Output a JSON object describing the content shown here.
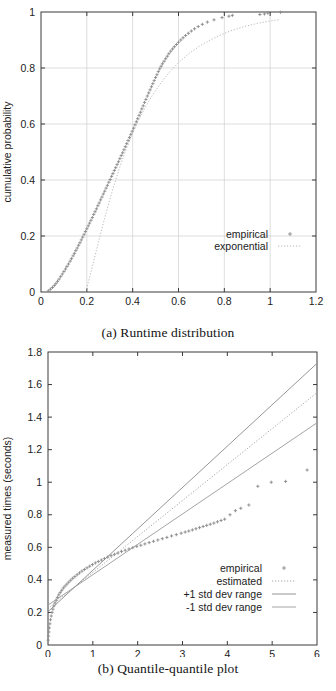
{
  "figure_a": {
    "caption": "(a) Runtime distribution",
    "legend": [
      {
        "label": "empirical",
        "style": "points",
        "color": "#8a8a8a"
      },
      {
        "label": "exponential",
        "style": "dotted",
        "color": "#b0b0b0"
      }
    ],
    "chart_data": {
      "type": "line",
      "title": "",
      "xlabel": "time to target solution value (seconds)",
      "ylabel": "cumulative probability",
      "xlim": [
        0,
        1.2
      ],
      "ylim": [
        0,
        1
      ],
      "xticks": [
        "0",
        "0.2",
        "0.4",
        "0.6",
        "0.8",
        "1",
        "1.2"
      ],
      "xtick_values": [
        0,
        0.2,
        0.4,
        0.6,
        0.8,
        1.0,
        1.2
      ],
      "yticks": [
        "0",
        "0.2",
        "0.4",
        "0.6",
        "0.8",
        "1"
      ],
      "ytick_values": [
        0,
        0.2,
        0.4,
        0.6,
        0.8,
        1.0
      ],
      "grid": true,
      "legend_position": "bottom-right",
      "series": [
        {
          "name": "empirical",
          "x": [
            0.032,
            0.041,
            0.05,
            0.058,
            0.065,
            0.072,
            0.079,
            0.086,
            0.093,
            0.1,
            0.107,
            0.113,
            0.12,
            0.127,
            0.133,
            0.14,
            0.146,
            0.152,
            0.158,
            0.164,
            0.17,
            0.176,
            0.182,
            0.188,
            0.194,
            0.2,
            0.206,
            0.212,
            0.218,
            0.224,
            0.23,
            0.236,
            0.242,
            0.248,
            0.254,
            0.26,
            0.266,
            0.272,
            0.278,
            0.284,
            0.29,
            0.296,
            0.302,
            0.308,
            0.314,
            0.32,
            0.326,
            0.332,
            0.338,
            0.344,
            0.35,
            0.356,
            0.362,
            0.368,
            0.374,
            0.38,
            0.386,
            0.392,
            0.398,
            0.404,
            0.41,
            0.416,
            0.422,
            0.428,
            0.434,
            0.44,
            0.446,
            0.452,
            0.458,
            0.464,
            0.47,
            0.476,
            0.482,
            0.488,
            0.494,
            0.5,
            0.506,
            0.512,
            0.518,
            0.524,
            0.53,
            0.537,
            0.544,
            0.551,
            0.558,
            0.566,
            0.574,
            0.582,
            0.591,
            0.6,
            0.61,
            0.62,
            0.631,
            0.643,
            0.656,
            0.67,
            0.686,
            0.704,
            0.726,
            0.755,
            0.79,
            0.82,
            0.835,
            0.955,
            0.975,
            0.99,
            1.045
          ],
          "y": [
            0.004,
            0.01,
            0.016,
            0.023,
            0.03,
            0.038,
            0.046,
            0.055,
            0.064,
            0.073,
            0.082,
            0.091,
            0.1,
            0.11,
            0.119,
            0.129,
            0.138,
            0.148,
            0.157,
            0.167,
            0.176,
            0.186,
            0.196,
            0.206,
            0.216,
            0.226,
            0.236,
            0.246,
            0.256,
            0.266,
            0.277,
            0.287,
            0.297,
            0.308,
            0.318,
            0.329,
            0.339,
            0.35,
            0.36,
            0.371,
            0.381,
            0.392,
            0.402,
            0.413,
            0.423,
            0.434,
            0.444,
            0.455,
            0.465,
            0.476,
            0.487,
            0.497,
            0.508,
            0.519,
            0.53,
            0.541,
            0.552,
            0.563,
            0.574,
            0.585,
            0.597,
            0.608,
            0.619,
            0.631,
            0.642,
            0.654,
            0.665,
            0.677,
            0.688,
            0.7,
            0.711,
            0.722,
            0.733,
            0.744,
            0.755,
            0.766,
            0.776,
            0.787,
            0.797,
            0.806,
            0.815,
            0.824,
            0.833,
            0.842,
            0.851,
            0.86,
            0.868,
            0.876,
            0.884,
            0.892,
            0.9,
            0.908,
            0.916,
            0.924,
            0.932,
            0.94,
            0.948,
            0.956,
            0.964,
            0.972,
            0.98,
            0.985,
            0.988,
            0.991,
            0.993,
            0.996,
            0.999
          ]
        },
        {
          "name": "exponential",
          "x": [
            0.195,
            0.205,
            0.215,
            0.228,
            0.242,
            0.258,
            0.276,
            0.296,
            0.318,
            0.342,
            0.368,
            0.396,
            0.426,
            0.458,
            0.492,
            0.528,
            0.566,
            0.606,
            0.648,
            0.692,
            0.738,
            0.786,
            0.836,
            0.888,
            0.942,
            0.998,
            1.045
          ],
          "y": [
            0.0,
            0.03,
            0.062,
            0.104,
            0.15,
            0.202,
            0.258,
            0.318,
            0.38,
            0.442,
            0.502,
            0.56,
            0.614,
            0.664,
            0.71,
            0.752,
            0.79,
            0.824,
            0.853,
            0.878,
            0.9,
            0.919,
            0.935,
            0.948,
            0.959,
            0.968,
            0.973
          ]
        }
      ]
    }
  },
  "figure_b": {
    "caption": "(b) Quantile-quantile plot",
    "legend": [
      {
        "label": "empirical",
        "style": "points",
        "color": "#8a8a8a"
      },
      {
        "label": "estimated",
        "style": "dotted",
        "color": "#9a9a9a"
      },
      {
        "label": "+1 std dev range",
        "style": "solid",
        "color": "#8a8a8a"
      },
      {
        "label": "-1 std dev range",
        "style": "solid",
        "color": "#9a9a9a"
      }
    ],
    "chart_data": {
      "type": "scatter",
      "title": "",
      "xlabel": "exponential quantiles",
      "ylabel": "measured times (seconds)",
      "xlim": [
        0,
        6
      ],
      "ylim": [
        0,
        1.8
      ],
      "xticks": [
        "0",
        "1",
        "2",
        "3",
        "4",
        "5",
        "6"
      ],
      "xtick_values": [
        0,
        1,
        2,
        3,
        4,
        5,
        6
      ],
      "yticks": [
        "0",
        "0.2",
        "0.4",
        "0.6",
        "0.8",
        "1",
        "1.2",
        "1.4",
        "1.6",
        "1.8"
      ],
      "ytick_values": [
        0,
        0.2,
        0.4,
        0.6,
        0.8,
        1.0,
        1.2,
        1.4,
        1.6,
        1.8
      ],
      "grid": false,
      "legend_position": "bottom-right",
      "series": [
        {
          "name": "empirical",
          "x": [
            0.005,
            0.012,
            0.02,
            0.03,
            0.042,
            0.056,
            0.072,
            0.09,
            0.11,
            0.132,
            0.156,
            0.182,
            0.21,
            0.24,
            0.272,
            0.306,
            0.342,
            0.38,
            0.42,
            0.462,
            0.506,
            0.552,
            0.6,
            0.65,
            0.702,
            0.756,
            0.812,
            0.87,
            0.93,
            0.992,
            1.056,
            1.122,
            1.19,
            1.26,
            1.332,
            1.406,
            1.482,
            1.56,
            1.64,
            1.722,
            1.806,
            1.892,
            1.98,
            2.07,
            2.162,
            2.256,
            2.352,
            2.45,
            2.55,
            2.652,
            2.756,
            2.862,
            2.97,
            3.06,
            3.14,
            3.22,
            3.3,
            3.38,
            3.46,
            3.54,
            3.62,
            3.7,
            3.78,
            3.86,
            3.94,
            4.06,
            4.18,
            4.3,
            4.48,
            4.68,
            4.98,
            5.3,
            5.78
          ],
          "y": [
            0.03,
            0.055,
            0.08,
            0.105,
            0.13,
            0.155,
            0.178,
            0.2,
            0.22,
            0.24,
            0.258,
            0.275,
            0.292,
            0.308,
            0.322,
            0.336,
            0.35,
            0.362,
            0.374,
            0.386,
            0.398,
            0.41,
            0.42,
            0.432,
            0.443,
            0.454,
            0.464,
            0.474,
            0.484,
            0.494,
            0.504,
            0.513,
            0.522,
            0.531,
            0.54,
            0.549,
            0.557,
            0.565,
            0.574,
            0.582,
            0.59,
            0.598,
            0.606,
            0.613,
            0.621,
            0.629,
            0.637,
            0.645,
            0.653,
            0.661,
            0.67,
            0.678,
            0.687,
            0.694,
            0.7,
            0.707,
            0.714,
            0.721,
            0.728,
            0.735,
            0.742,
            0.749,
            0.757,
            0.765,
            0.773,
            0.8,
            0.825,
            0.84,
            0.86,
            0.975,
            1.0,
            1.005,
            1.075
          ]
        },
        {
          "name": "estimated",
          "x": [
            0,
            6
          ],
          "y": [
            0.225,
            1.55
          ]
        },
        {
          "name": "+1 std dev range",
          "x": [
            0,
            6
          ],
          "y": [
            0.205,
            1.73
          ]
        },
        {
          "name": "-1 std dev range",
          "x": [
            0,
            6
          ],
          "y": [
            0.245,
            1.365
          ]
        }
      ]
    }
  }
}
